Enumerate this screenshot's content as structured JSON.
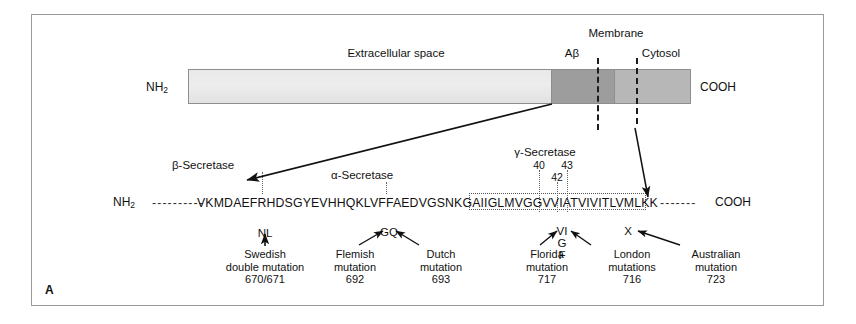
{
  "panel": {
    "letter": "A"
  },
  "schematic": {
    "n_terminus": "NH",
    "n_terminus_sub": "2",
    "c_terminus": "COOH",
    "labels": {
      "extracellular": "Extracellular space",
      "abeta": "Aβ",
      "membrane": "Membrane",
      "cytosol": "Cytosol"
    },
    "colors": {
      "extracellular_fill": "#ebebeb",
      "abeta_fill": "#9d9d9d",
      "cytosol_fill": "#b7b7b7",
      "outline": "#8e8e8e",
      "line": "#1b1b1b"
    }
  },
  "sequence": {
    "n_terminus": "NH",
    "n_terminus_sub": "2",
    "c_terminus": "COOH",
    "left_dashes": "----------",
    "right_dashes": "-------",
    "residues": "VKMDAEFRHDSGYEVHHQKLVFFAEDVGSNKGAIIGLMVGGVVIATVIVITLVMLKK"
  },
  "secretases": [
    {
      "name": "beta",
      "label": "β-Secretase"
    },
    {
      "name": "alpha",
      "label": "α-Secretase"
    },
    {
      "name": "gamma",
      "label": "γ-Secretase"
    }
  ],
  "gamma_sites": [
    {
      "number": "40"
    },
    {
      "number": "42"
    },
    {
      "number": "43"
    }
  ],
  "mutations": [
    {
      "key": "swedish",
      "residues": "NL",
      "name_line1": "Swedish",
      "name_line2": "double mutation",
      "codon": "670/671"
    },
    {
      "key": "flemish",
      "residues": "GQ",
      "name_line1": "Flemish",
      "name_line2": "mutation",
      "codon": "692"
    },
    {
      "key": "dutch",
      "residues": "GQ",
      "name_line1": "Dutch",
      "name_line2": "mutation",
      "codon": "693"
    },
    {
      "key": "florida",
      "residues": "VI",
      "name_line1": "Florida",
      "name_line2": "mutation",
      "codon": "717"
    },
    {
      "key": "london",
      "residues": "VI",
      "name_line1": "London",
      "name_line2": "mutations",
      "codon": "716"
    },
    {
      "key": "australian",
      "residues": "X",
      "name_line1": "Australian",
      "name_line2": "mutation",
      "codon": "723"
    }
  ],
  "residue_stack": {
    "line1": "VI",
    "line2": "G",
    "line3": "F",
    "australian": "X"
  }
}
